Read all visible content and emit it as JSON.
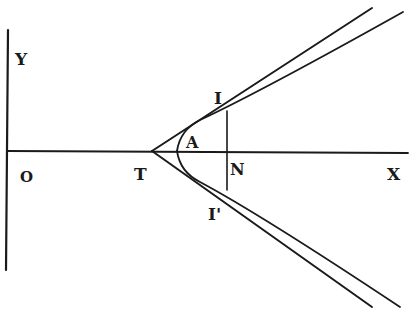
{
  "diagram": {
    "colors": {
      "ink": "#1a1a1a",
      "background": "#ffffff"
    },
    "labels": {
      "y_axis": "Y",
      "origin": "O",
      "tangent_point": "T",
      "vertex": "A",
      "point_upper": "I",
      "foot": "N",
      "point_lower": "I'",
      "x_axis": "X"
    }
  }
}
